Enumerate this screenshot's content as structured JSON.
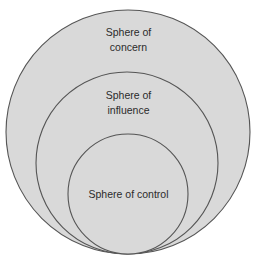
{
  "diagram": {
    "type": "nested-circles",
    "background": "#ffffff",
    "fill": "#d9d9d9",
    "stroke": "#555555",
    "text_color": "#2b2b2b",
    "circles": [
      {
        "id": "concern",
        "cx": 128,
        "cy": 132,
        "r": 122,
        "label_lines": [
          "Sphere of",
          "concern"
        ]
      },
      {
        "id": "influence",
        "cx": 127,
        "cy": 163,
        "r": 91,
        "label_lines": [
          "Sphere of",
          "influence"
        ]
      },
      {
        "id": "control",
        "cx": 128,
        "cy": 194,
        "r": 60,
        "label_lines": [
          "Sphere of control"
        ]
      }
    ]
  }
}
